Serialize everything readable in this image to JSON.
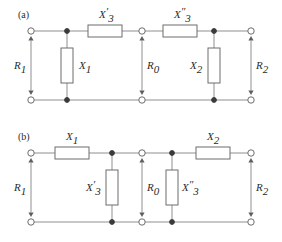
{
  "figure": {
    "panels": [
      {
        "id": "a",
        "label": "(a)",
        "label_x": 18,
        "label_y": 18,
        "top_rail_y": 31,
        "bottom_rail_y": 100,
        "rail_x_start": 31,
        "rail_x_end": 251,
        "series_components": [
          {
            "name": "X3-prime-series",
            "label_base": "X",
            "label_sub": "3",
            "label_prime": "′",
            "box_x": 88,
            "box_y": 25,
            "box_w": 34,
            "box_h": 12,
            "label_x": 99,
            "label_y": 18
          },
          {
            "name": "X3-double-prime-series",
            "label_base": "X",
            "label_sub": "3",
            "label_prime": "″",
            "box_x": 163,
            "box_y": 25,
            "box_w": 34,
            "box_h": 12,
            "label_x": 174,
            "label_y": 18
          }
        ],
        "shunt_components": [
          {
            "name": "X1-shunt",
            "label_base": "X",
            "label_sub": "1",
            "label_prime": "",
            "box_x": 61,
            "box_y": 48,
            "box_w": 12,
            "box_h": 35,
            "stem_x": 67,
            "label_x": 79,
            "label_y": 69
          },
          {
            "name": "X2-shunt",
            "label_base": "X",
            "label_sub": "2",
            "label_prime": "",
            "box_x": 208,
            "box_y": 48,
            "box_w": 12,
            "box_h": 35,
            "stem_x": 214,
            "label_x": 190,
            "label_y": 69
          }
        ],
        "port_arrows": [
          {
            "name": "R1-port-arrow",
            "label_base": "R",
            "label_sub": "1",
            "x": 31,
            "label_x": 14,
            "label_y": 69
          },
          {
            "name": "R0-port-arrow",
            "label_base": "R",
            "label_sub": "0",
            "x": 142,
            "label_x": 147,
            "label_y": 69
          },
          {
            "name": "R2-port-arrow",
            "label_base": "R",
            "label_sub": "2",
            "x": 251,
            "label_x": 256,
            "label_y": 69
          }
        ],
        "open_terminals_x": [
          31,
          142,
          251
        ],
        "node_dots_x": [
          67,
          214
        ]
      },
      {
        "id": "b",
        "label": "(b)",
        "label_x": 18,
        "label_y": 140,
        "top_rail_y": 153,
        "bottom_rail_y": 222,
        "rail_x_start": 31,
        "rail_x_end": 251,
        "series_components": [
          {
            "name": "X1-series",
            "label_base": "X",
            "label_sub": "1",
            "label_prime": "",
            "box_x": 55,
            "box_y": 147,
            "box_w": 34,
            "box_h": 12,
            "label_x": 66,
            "label_y": 140
          },
          {
            "name": "X2-series",
            "label_base": "X",
            "label_sub": "2",
            "label_prime": "",
            "box_x": 196,
            "box_y": 147,
            "box_w": 34,
            "box_h": 12,
            "label_x": 207,
            "label_y": 140
          }
        ],
        "shunt_components": [
          {
            "name": "X3-prime-shunt",
            "label_base": "X",
            "label_sub": "3",
            "label_prime": "′",
            "box_x": 106,
            "box_y": 170,
            "box_w": 12,
            "box_h": 35,
            "stem_x": 112,
            "label_x": 86,
            "label_y": 191
          },
          {
            "name": "X3-double-prime-shunt",
            "label_base": "X",
            "label_sub": "3",
            "label_prime": "″",
            "box_x": 166,
            "box_y": 170,
            "box_w": 12,
            "box_h": 35,
            "stem_x": 172,
            "label_x": 182,
            "label_y": 191
          }
        ],
        "port_arrows": [
          {
            "name": "R1-port-arrow",
            "label_base": "R",
            "label_sub": "1",
            "x": 31,
            "label_x": 14,
            "label_y": 191
          },
          {
            "name": "R0-port-arrow",
            "label_base": "R",
            "label_sub": "0",
            "x": 142,
            "label_x": 147,
            "label_y": 191
          },
          {
            "name": "R2-port-arrow",
            "label_base": "R",
            "label_sub": "2",
            "x": 251,
            "label_x": 256,
            "label_y": 191
          }
        ],
        "open_terminals_x": [
          31,
          142,
          251
        ],
        "node_dots_x": [
          112,
          172
        ]
      }
    ],
    "colors": {
      "wire": "#8f8f8f",
      "box_stroke": "#6d6d6d",
      "node_fill": "#3a3a3a",
      "text": "#2b2b2b",
      "background": "#ffffff"
    }
  }
}
